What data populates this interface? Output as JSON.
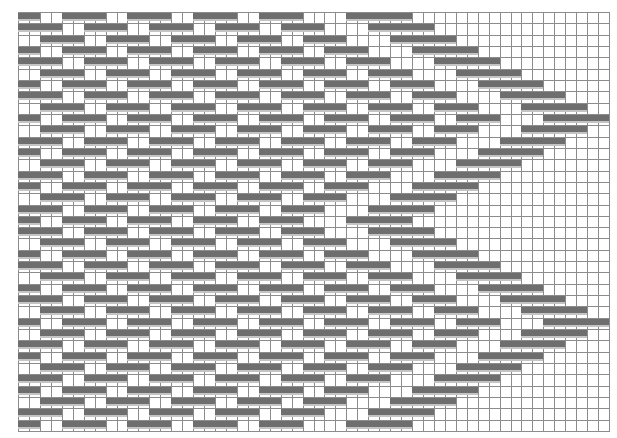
{
  "draft": {
    "title": "",
    "columns": 54,
    "rows_count": 37,
    "colors": {
      "filled": "#6e6e6e",
      "filled_shadow": "#c4c4c4",
      "grid_line": "#8c8c8c",
      "background": "#ffffff"
    },
    "row_phase_sequence": [
      0,
      1,
      2,
      3,
      4,
      5,
      6,
      7,
      8,
      9,
      8,
      7,
      6,
      5,
      4,
      3,
      2,
      1,
      0,
      1,
      2,
      3,
      4,
      5,
      6,
      7,
      8,
      9,
      8,
      7,
      6,
      5,
      4,
      3,
      2,
      1,
      0
    ],
    "phase_patterns": [
      "110011110011110011110011110000111111000000000000000000",
      "111100111100111100111100111100001111110000000000000000",
      "001111001111001111001111001111000011111100000000000000",
      "110011110011110011110011110011110000111111000000000000",
      "111100111100111100111100111100111100001111110000000000",
      "001111001111001111001111001111001111000011111100000000",
      "110011110011110011110011110011110011110000111111000000",
      "111100111100111100111100111100111100111100001111110000",
      "001111001111001111001111001111001111001111000011111100",
      "110011110011110011110011110011110011110011110000111111"
    ]
  }
}
